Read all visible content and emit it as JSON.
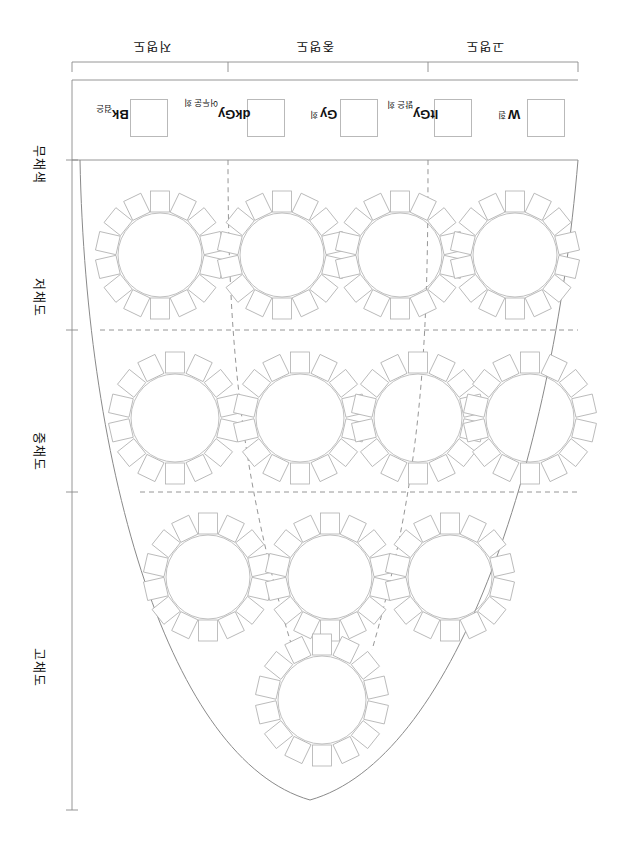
{
  "diagram": {
    "title_present": false,
    "orientation_note": "rotated-180",
    "stroke_color": "#8a8a8a",
    "text_color": "#111111",
    "swatch_border_color": "#b9b9b9"
  },
  "lightness_bands": [
    {
      "label": "저명도"
    },
    {
      "label": "중명도"
    },
    {
      "label": "고명도"
    }
  ],
  "chroma_rows": [
    {
      "label": "무채색"
    },
    {
      "label": "저채도"
    },
    {
      "label": "중채도"
    },
    {
      "label": "고채도"
    }
  ],
  "achromatic_swatches": [
    {
      "code": "Bk",
      "korean": "검은",
      "fill": "#ffffff"
    },
    {
      "code": "dkGy",
      "korean": "어두운 회",
      "fill": "#ffffff"
    },
    {
      "code": "Gy",
      "korean": "회",
      "fill": "#ffffff"
    },
    {
      "code": "ltGy",
      "korean": "밝은 회",
      "fill": "#ffffff"
    },
    {
      "code": "W",
      "korean": "흰",
      "fill": "#ffffff"
    }
  ],
  "color_wheels": {
    "count": 12,
    "petals_per_wheel": 14,
    "rows": [
      {
        "row": "저채도",
        "wheels": 4
      },
      {
        "row": "중채도",
        "wheels": 4
      },
      {
        "row": "고채도",
        "wheels": 4
      }
    ]
  }
}
